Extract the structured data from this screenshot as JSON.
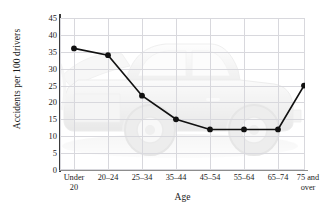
{
  "chart_data": {
    "type": "line",
    "title": "",
    "xlabel": "Age",
    "ylabel": "Accidents per 100 drivers",
    "categories": [
      "Under 20",
      "20–24",
      "25–34",
      "35–44",
      "45–54",
      "55–64",
      "65–74",
      "75 and over"
    ],
    "category_lines": [
      [
        "Under",
        "20"
      ],
      [
        "20–24",
        ""
      ],
      [
        "25–34",
        ""
      ],
      [
        "35–44",
        ""
      ],
      [
        "45–54",
        ""
      ],
      [
        "55–64",
        ""
      ],
      [
        "65–74",
        ""
      ],
      [
        "75 and",
        "over"
      ]
    ],
    "values": [
      36,
      34,
      22,
      15,
      12,
      12,
      12,
      25
    ],
    "ylim": [
      0,
      45
    ],
    "yticks": [
      0,
      5,
      10,
      15,
      20,
      25,
      30,
      35,
      40,
      45
    ],
    "ytick_labels": [
      "0",
      "5",
      "10",
      "15",
      "20",
      "25",
      "30",
      "35",
      "40",
      "45"
    ],
    "grid": true,
    "legend": "none",
    "marker": "filled-circle",
    "line_color": "#111111",
    "grid_color": "#d8d8dd",
    "background_image": "pickup-truck-watermark"
  }
}
